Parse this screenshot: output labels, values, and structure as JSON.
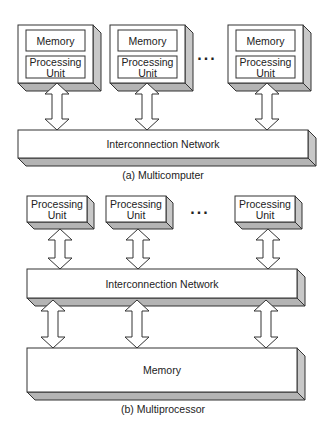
{
  "diagram_a": {
    "caption": "(a) Multicomputer",
    "nodes": [
      {
        "memory_label": "Memory",
        "pu_label_line1": "Processing",
        "pu_label_line2": "Unit"
      },
      {
        "memory_label": "Memory",
        "pu_label_line1": "Processing",
        "pu_label_line2": "Unit"
      },
      {
        "memory_label": "Memory",
        "pu_label_line1": "Processing",
        "pu_label_line2": "Unit"
      }
    ],
    "ellipsis": "...",
    "network_label": "Interconnection Network"
  },
  "diagram_b": {
    "caption": "(b) Multiprocessor",
    "processors": [
      {
        "line1": "Processing",
        "line2": "Unit"
      },
      {
        "line1": "Processing",
        "line2": "Unit"
      },
      {
        "line1": "Processing",
        "line2": "Unit"
      }
    ],
    "ellipsis": "...",
    "network_label": "Interconnection Network",
    "memory_label": "Memory"
  },
  "colors": {
    "stroke": "#333333",
    "side_shade": "#c8c8c8",
    "bottom_shade": "#b4b4b4",
    "background": "#ffffff"
  }
}
